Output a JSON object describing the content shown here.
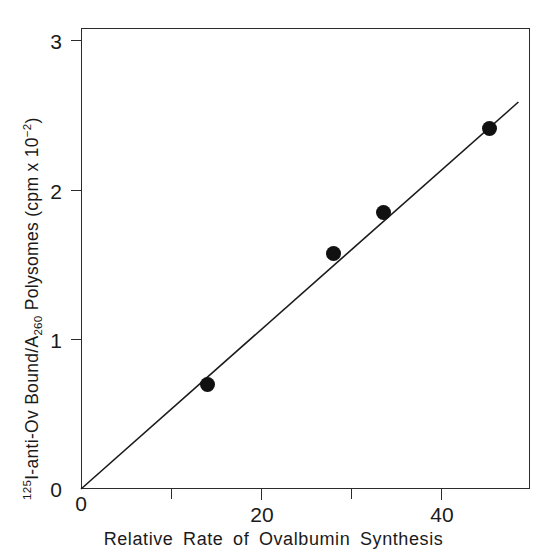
{
  "chart_data": {
    "type": "scatter",
    "title": "",
    "xlabel": "Relative  Rate  of  Ovalbumin  Synthesis",
    "ylabel_parts": {
      "iodine_mass": "125",
      "iodine_symbol": "I",
      "mid": "-anti-Ov  Bound/A",
      "a_subscript": "260",
      "tail": "  Polysomes  (cpm x 10",
      "exponent": "−2",
      "close": ")"
    },
    "ylabel_plain": "125I-anti-Ov Bound/A260 Polysomes (cpm x 10^-2)",
    "xlim": [
      0,
      49.9
    ],
    "ylim": [
      0,
      3.08
    ],
    "xticks": [
      0,
      20,
      40
    ],
    "xtick_labels": [
      "0",
      "20",
      "40"
    ],
    "xminorticks": [
      10,
      30
    ],
    "yticks": [
      0,
      1,
      2,
      3
    ],
    "ytick_labels": [
      "0",
      "1",
      "2",
      "3"
    ],
    "grid": false,
    "legend": "none",
    "marker_style": "filled-circle",
    "marker_color": "#111111",
    "axis_color": "#2b2b2b",
    "points": [
      {
        "x": 14.0,
        "y": 0.7
      },
      {
        "x": 28.1,
        "y": 1.57
      },
      {
        "x": 33.6,
        "y": 1.85
      },
      {
        "x": 45.4,
        "y": 2.41
      }
    ],
    "fit_line": {
      "type": "linear-through-origin",
      "slope": 0.0532,
      "intercept": 0.0,
      "x_start": 0.0,
      "x_end": 48.6,
      "y_start": 0.0,
      "y_end": 2.585
    }
  }
}
